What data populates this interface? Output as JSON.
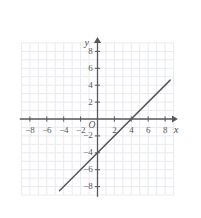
{
  "chart_data": {
    "type": "line",
    "title": "",
    "xlabel": "x",
    "ylabel": "y",
    "origin_label": "O",
    "xlim": [
      -9.2,
      9.4
    ],
    "ylim": [
      -9.2,
      9.6
    ],
    "grid": true,
    "grid_step": 1,
    "legend": "none",
    "x_ticks": [
      -8,
      -6,
      -4,
      -2,
      2,
      4,
      6,
      8
    ],
    "y_ticks": [
      -8,
      -6,
      -4,
      -2,
      2,
      4,
      6,
      8
    ],
    "x_tick_labels": [
      "−8",
      "−6",
      "−4",
      "−2",
      "2",
      "4",
      "6",
      "8"
    ],
    "y_tick_labels": [
      "−8",
      "−6",
      "−4",
      "−2",
      "2",
      "4",
      "6",
      "8"
    ],
    "series": [
      {
        "name": "line",
        "equation": "y = x - 4",
        "slope": 1,
        "intercept": -4,
        "x_intercept": 4,
        "y_intercept": -4,
        "points": [
          [
            -4.5,
            -8.5
          ],
          [
            8.6,
            4.6
          ]
        ],
        "color": "#58585a"
      }
    ],
    "axis_color": "#58585a",
    "grid_color": "#e8eaf0",
    "background": "#ffffff"
  },
  "geometry": {
    "origin_px": [
      97.5,
      119.0
    ],
    "unit_px": 8.45
  }
}
